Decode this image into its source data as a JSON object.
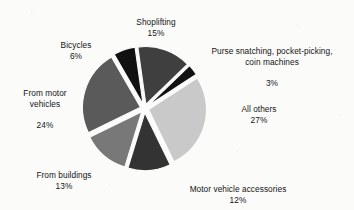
{
  "chart_data": {
    "type": "pie",
    "title": "",
    "subtitle": "",
    "xlabel": "",
    "ylabel": "",
    "legend_position": "none",
    "grid": false,
    "exploded": true,
    "units": "percent",
    "total": 100,
    "categories": [
      "Shoplifting",
      "Purse snatching, pocket-picking, coin machines",
      "All others",
      "Motor vehicle accessories",
      "From buildings",
      "From motor vehicles",
      "Bicycles"
    ],
    "values": [
      15,
      3,
      27,
      12,
      13,
      24,
      6
    ],
    "slices": [
      {
        "key": "shoplifting",
        "label": "Shoplifting",
        "value": 15,
        "value_text": "15%",
        "color": "#3f3f3f",
        "start_angle": 352,
        "end_angle": 46
      },
      {
        "key": "purse",
        "label": "Purse snatching, pocket-picking, coin machines",
        "label_line1": "Purse snatching, pocket-picking,",
        "label_line2": "coin machines",
        "value": 3,
        "value_text": "3%",
        "color": "#121212",
        "start_angle": 46,
        "end_angle": 57
      },
      {
        "key": "all-others",
        "label": "All others",
        "value": 27,
        "value_text": "27%",
        "color": "#c9c9c9",
        "start_angle": 57,
        "end_angle": 154
      },
      {
        "key": "motor-vehicle-accessories",
        "label": "Motor vehicle accessories",
        "value": 12,
        "value_text": "12%",
        "color": "#333333",
        "start_angle": 154,
        "end_angle": 197
      },
      {
        "key": "from-buildings",
        "label": "From buildings",
        "value": 13,
        "value_text": "13%",
        "color": "#787878",
        "start_angle": 197,
        "end_angle": 244
      },
      {
        "key": "from-motor-vehicles",
        "label": "From motor vehicles",
        "label_line1": "From motor",
        "label_line2": "vehicles",
        "value": 24,
        "value_text": "24%",
        "color": "#5a5a5a",
        "start_angle": 244,
        "end_angle": 330
      },
      {
        "key": "bicycles",
        "label": "Bicycles",
        "value": 6,
        "value_text": "6%",
        "color": "#111111",
        "start_angle": 330,
        "end_angle": 352
      }
    ],
    "background_color": "#fbfbfa"
  }
}
